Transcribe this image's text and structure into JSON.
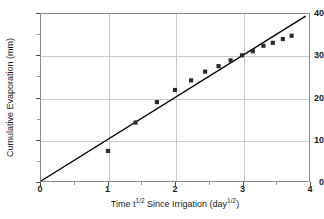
{
  "chart_data": {
    "type": "scatter",
    "title": "",
    "xlabel": "Time t¹ᐟ² Since Irrigation (day¹ᐟ²)",
    "xlabel_parts": {
      "pre": "Time t",
      "sup1": "1/2",
      "mid": " Since Irrigation (day",
      "sup2": "1/2",
      "post": ")"
    },
    "ylabel": "Cumulative Evaporation (mm)",
    "xlim": [
      0,
      4
    ],
    "ylim": [
      0,
      40
    ],
    "x_ticks": [
      0,
      1,
      2,
      3,
      4
    ],
    "x_tick_labels": [
      "0",
      "1",
      "2",
      "3",
      "4"
    ],
    "x_minor_ticks": [
      0.5,
      1.5,
      2.5,
      3.5
    ],
    "y_ticks": [
      0,
      10,
      20,
      30,
      40
    ],
    "y_tick_labels": [
      "0",
      "10",
      "20",
      "30",
      "40"
    ],
    "y_minor_ticks": [
      5,
      15,
      25,
      35
    ],
    "grid": true,
    "grid_color": "#c9c9c9",
    "legend": false,
    "marker_color": "#2b2b2b",
    "marker_shape": "square",
    "line_color": "#000000",
    "series": [
      {
        "name": "Cumulative evaporation",
        "points": [
          [
            1.0,
            7.2
          ],
          [
            1.41,
            14.0
          ],
          [
            1.73,
            18.9
          ],
          [
            2.0,
            21.8
          ],
          [
            2.24,
            24.1
          ],
          [
            2.45,
            26.2
          ],
          [
            2.65,
            27.5
          ],
          [
            2.83,
            28.9
          ],
          [
            3.0,
            30.1
          ],
          [
            3.16,
            31.1
          ],
          [
            3.32,
            32.4
          ],
          [
            3.46,
            33.1
          ],
          [
            3.61,
            34.0
          ],
          [
            3.74,
            34.8
          ]
        ]
      }
    ],
    "trend_line": {
      "name": "1:1 fitted line through origin",
      "slope": 10.0,
      "intercept": 0.0,
      "x_start": 0.0,
      "y_start": 0.0,
      "x_end": 3.95,
      "y_end": 39.5
    }
  }
}
